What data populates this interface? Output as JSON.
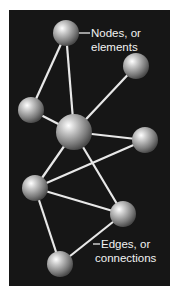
{
  "panel": {
    "x": 9,
    "y": 10,
    "width": 161,
    "height": 276,
    "background": "#161616"
  },
  "edge_color": "#e8e8e8",
  "nodes": [
    {
      "id": "n1",
      "cx": 66,
      "cy": 33,
      "r": 13
    },
    {
      "id": "n2",
      "cx": 136,
      "cy": 66,
      "r": 13
    },
    {
      "id": "n3",
      "cx": 31,
      "cy": 110,
      "r": 13
    },
    {
      "id": "n4",
      "cx": 74,
      "cy": 132,
      "r": 18
    },
    {
      "id": "n5",
      "cx": 145,
      "cy": 140,
      "r": 13
    },
    {
      "id": "n6",
      "cx": 35,
      "cy": 188,
      "r": 13
    },
    {
      "id": "n7",
      "cx": 123,
      "cy": 214,
      "r": 13
    },
    {
      "id": "n8",
      "cx": 60,
      "cy": 264,
      "r": 13
    }
  ],
  "edges": [
    [
      "n1",
      "n3"
    ],
    [
      "n1",
      "n4"
    ],
    [
      "n4",
      "n2"
    ],
    [
      "n3",
      "n4"
    ],
    [
      "n4",
      "n5"
    ],
    [
      "n5",
      "n6"
    ],
    [
      "n4",
      "n6"
    ],
    [
      "n4",
      "n7"
    ],
    [
      "n6",
      "n7"
    ],
    [
      "n6",
      "n8"
    ],
    [
      "n8",
      "n7"
    ]
  ],
  "labels": {
    "nodes": {
      "line1": "Nodes, or",
      "line2": "elements"
    },
    "edges": {
      "line1": "Edges, or",
      "line2": "connections"
    }
  }
}
